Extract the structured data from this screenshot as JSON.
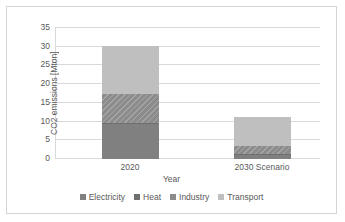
{
  "chart_data": {
    "type": "bar",
    "stacked": true,
    "title": "",
    "xlabel": "Year",
    "ylabel": "CO2 emissions [Mton]",
    "categories": [
      "2020",
      "2030 Scenario"
    ],
    "ylim": [
      0,
      35
    ],
    "yticks": [
      "0",
      "5",
      "10",
      "15",
      "20",
      "25",
      "30",
      "35"
    ],
    "ytick_values": [
      0,
      5,
      10,
      15,
      20,
      25,
      30,
      35
    ],
    "grid": true,
    "legend_position": "bottom",
    "series": [
      {
        "name": "Electricity",
        "color": "#808080",
        "values": [
          9.4,
          1.3
        ]
      },
      {
        "name": "Heat",
        "color": "#6f6f6f",
        "values": [
          0.1,
          0.1
        ]
      },
      {
        "name": "Industry",
        "color": "#8c8c8c",
        "values": [
          8.0,
          2.1
        ]
      },
      {
        "name": "Transport",
        "color": "#bfbfbf",
        "values": [
          12.7,
          7.8
        ]
      }
    ],
    "totals": [
      30.2,
      11.3
    ]
  },
  "legend": {
    "items": [
      {
        "label": "Electricity",
        "color": "#808080"
      },
      {
        "label": "Heat",
        "color": "#6f6f6f"
      },
      {
        "label": "Industry",
        "color": "#8c8c8c"
      },
      {
        "label": "Transport",
        "color": "#bfbfbf"
      }
    ]
  },
  "style": {
    "grid_color": "#d9d9d9",
    "text_color": "#595959",
    "border_color": "#d4d4d4",
    "background": "#ffffff"
  }
}
